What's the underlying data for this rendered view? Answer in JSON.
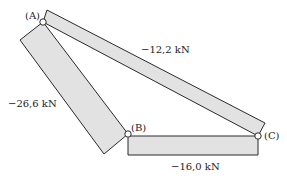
{
  "diagram": {
    "type": "truss-member-forces",
    "nodes": [
      {
        "id": "A",
        "label": "(A)"
      },
      {
        "id": "B",
        "label": "(B)"
      },
      {
        "id": "C",
        "label": "(C)"
      }
    ],
    "members": [
      {
        "from": "A",
        "to": "C",
        "force_label": "−12,2 kN"
      },
      {
        "from": "A",
        "to": "B",
        "force_label": "−26,6 kN"
      },
      {
        "from": "B",
        "to": "C",
        "force_label": "−16,0 kN"
      }
    ]
  }
}
